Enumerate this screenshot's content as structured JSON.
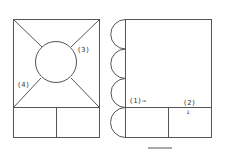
{
  "diagram": {
    "type": "net/layout diagram",
    "left_figure": {
      "labels": [
        {
          "id": "3",
          "text": "(3)",
          "x": 77,
          "y": 52
        },
        {
          "id": "4",
          "text": "(4)",
          "x": 17,
          "y": 87
        }
      ]
    },
    "right_figure": {
      "labels": [
        {
          "id": "1",
          "text": "(1)→",
          "x": 129,
          "y": 102
        },
        {
          "id": "2",
          "text": "(2)",
          "x": 183,
          "y": 104
        },
        {
          "id": "2-arrow",
          "text": "↓",
          "x": 186,
          "y": 113
        }
      ],
      "semicircle_count": 4
    },
    "colors": {
      "line": "#555555",
      "text": "#333333",
      "background": "#ffffff"
    }
  }
}
